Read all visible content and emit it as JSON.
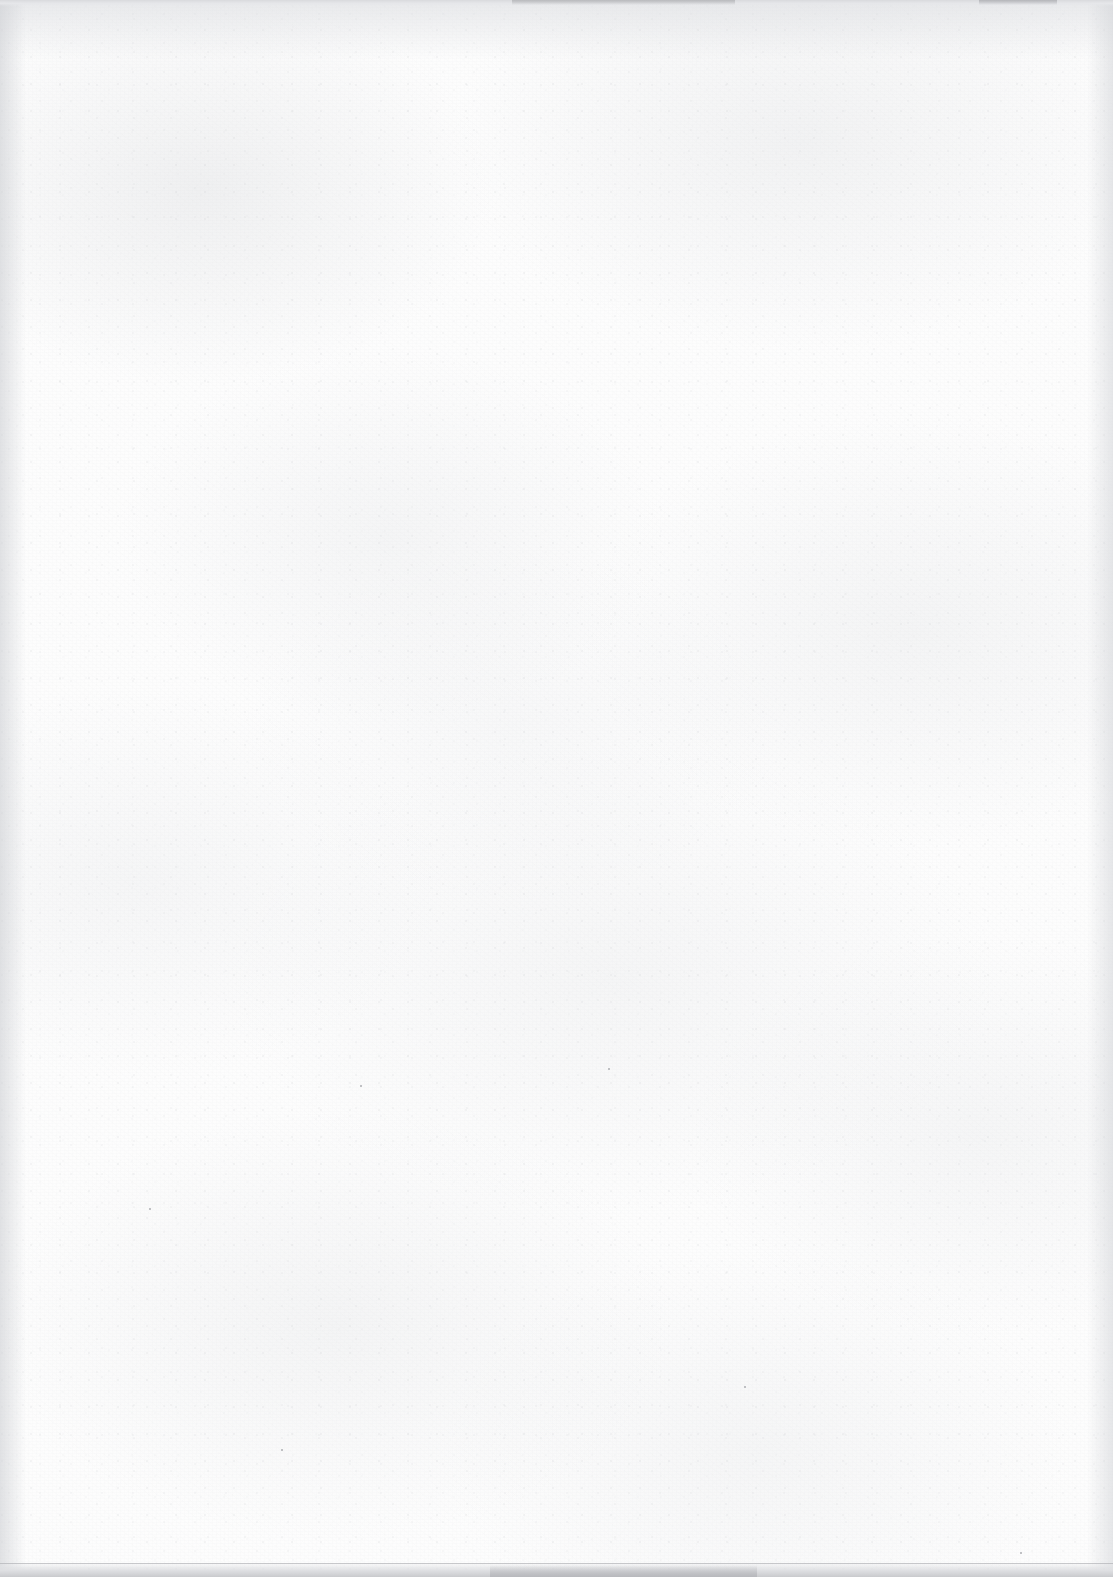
{
  "document": {
    "kind": "scanned-page",
    "page_content_text": "",
    "visible_text_count": 0,
    "description_label": "blank scanned sheet"
  },
  "canvas": {
    "width_px": 1113,
    "height_px": 1577
  },
  "colors": {
    "paper": "#fdfdfd",
    "paper_shade": "#e9eaec",
    "edge_shadow": "#cdcfd3",
    "scan_band_top": "#d9dadd",
    "scan_band_bottom": "#c9cacd",
    "speck": "#adaeb2"
  },
  "artifacts": {
    "top_band_label": "scanner-edge-band-top",
    "bottom_band_label": "scanner-edge-band-bottom",
    "left_vignette_label": "page-edge-shadow-left",
    "right_vignette_label": "page-edge-shadow-right",
    "specks": [
      {
        "x_px": 608,
        "y_px": 1068,
        "size_px": 2
      },
      {
        "x_px": 360,
        "y_px": 1085,
        "size_px": 2
      },
      {
        "x_px": 744,
        "y_px": 1386,
        "size_px": 2
      },
      {
        "x_px": 281,
        "y_px": 1449,
        "size_px": 2
      },
      {
        "x_px": 1020,
        "y_px": 1552,
        "size_px": 2
      },
      {
        "x_px": 149,
        "y_px": 1208,
        "size_px": 2
      }
    ]
  }
}
